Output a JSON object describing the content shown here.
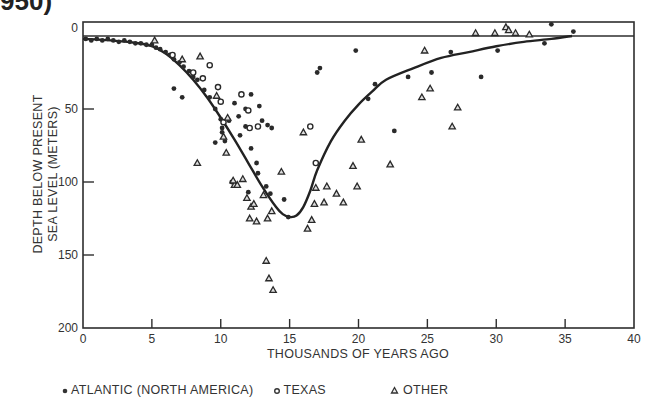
{
  "chart_data": {
    "type": "scatter",
    "title": "",
    "xlabel": "THOUSANDS OF YEARS AGO",
    "ylabel_line1": "DEPTH BELOW PRESENT",
    "ylabel_line2": "SEA LEVEL (METERS)",
    "xlim": [
      0,
      40
    ],
    "ylim": [
      0,
      200
    ],
    "y_inverted": true,
    "x_ticks": [
      0,
      5,
      10,
      15,
      20,
      25,
      30,
      35,
      40
    ],
    "y_ticks": [
      0,
      50,
      100,
      150,
      200
    ],
    "grid": false,
    "legend_position": "bottom",
    "legend": [
      {
        "label": "ATLANTIC (NORTH AMERICA)",
        "marker": "filled-circle"
      },
      {
        "label": "TEXAS",
        "marker": "open-circle"
      },
      {
        "label": "OTHER",
        "marker": "open-triangle"
      }
    ],
    "trend_curve": {
      "name": "fitted sea-level curve",
      "points": [
        [
          0,
          2
        ],
        [
          2,
          3
        ],
        [
          4,
          5
        ],
        [
          5,
          7
        ],
        [
          6,
          12
        ],
        [
          7,
          20
        ],
        [
          8,
          30
        ],
        [
          9,
          42
        ],
        [
          10,
          56
        ],
        [
          11,
          71
        ],
        [
          12,
          87
        ],
        [
          13,
          103
        ],
        [
          14,
          117
        ],
        [
          14.5,
          122
        ],
        [
          15,
          124
        ],
        [
          15.5,
          123
        ],
        [
          16,
          117
        ],
        [
          16.5,
          106
        ],
        [
          17,
          92
        ],
        [
          18,
          72
        ],
        [
          19,
          58
        ],
        [
          20,
          47
        ],
        [
          21,
          38
        ],
        [
          22,
          30
        ],
        [
          24,
          22
        ],
        [
          26,
          15
        ],
        [
          28,
          11
        ],
        [
          30,
          7
        ],
        [
          32,
          4
        ],
        [
          34,
          2
        ],
        [
          35.5,
          0
        ]
      ]
    },
    "series": [
      {
        "name": "ATLANTIC (NORTH AMERICA)",
        "marker": "filled-circle",
        "points": [
          [
            0.2,
            2
          ],
          [
            0.6,
            3
          ],
          [
            1,
            2
          ],
          [
            1.4,
            3
          ],
          [
            1.8,
            2
          ],
          [
            2.2,
            3
          ],
          [
            2.6,
            4
          ],
          [
            3,
            3
          ],
          [
            3.4,
            4
          ],
          [
            3.8,
            5
          ],
          [
            4.2,
            5
          ],
          [
            4.6,
            6
          ],
          [
            5,
            6
          ],
          [
            5.3,
            8
          ],
          [
            5.6,
            9
          ],
          [
            6,
            11
          ],
          [
            6.3,
            13
          ],
          [
            6.6,
            16
          ],
          [
            7,
            18
          ],
          [
            7.3,
            21
          ],
          [
            7.7,
            24
          ],
          [
            8,
            28
          ],
          [
            8.3,
            30
          ],
          [
            6.6,
            36
          ],
          [
            7.2,
            42
          ],
          [
            9.2,
            42
          ],
          [
            9.6,
            50
          ],
          [
            10,
            57
          ],
          [
            10.1,
            63
          ],
          [
            10.1,
            66
          ],
          [
            10.3,
            72
          ],
          [
            10.6,
            58
          ],
          [
            11,
            46
          ],
          [
            11.3,
            55
          ],
          [
            11.8,
            50
          ],
          [
            12.2,
            40
          ],
          [
            12.8,
            48
          ],
          [
            13,
            58
          ],
          [
            13.4,
            61
          ],
          [
            13.7,
            63
          ],
          [
            11.8,
            62
          ],
          [
            11.4,
            68
          ],
          [
            12.2,
            77
          ],
          [
            12.6,
            87
          ],
          [
            12.7,
            94
          ],
          [
            13.3,
            103
          ],
          [
            13.6,
            108
          ],
          [
            14.6,
            112
          ],
          [
            14.9,
            124
          ],
          [
            17,
            25
          ],
          [
            17.2,
            22
          ],
          [
            19.8,
            10
          ],
          [
            20.7,
            43
          ],
          [
            21.2,
            33
          ],
          [
            22.6,
            65
          ],
          [
            23.6,
            28
          ],
          [
            25.3,
            25
          ],
          [
            26.7,
            11
          ],
          [
            28.9,
            28
          ],
          [
            30.1,
            10
          ],
          [
            33.5,
            5
          ],
          [
            34,
            -8
          ],
          [
            35.6,
            -3
          ],
          [
            8.8,
            37
          ],
          [
            9.6,
            73
          ],
          [
            10.8,
            100
          ],
          [
            12,
            107
          ]
        ]
      },
      {
        "name": "TEXAS",
        "marker": "open-circle",
        "points": [
          [
            6.5,
            13
          ],
          [
            8,
            25
          ],
          [
            8.7,
            29
          ],
          [
            9.2,
            20
          ],
          [
            9.8,
            35
          ],
          [
            10,
            45
          ],
          [
            10.2,
            59
          ],
          [
            11.5,
            40
          ],
          [
            12,
            51
          ],
          [
            12.1,
            63
          ],
          [
            12.7,
            62
          ],
          [
            16.5,
            62
          ],
          [
            16.9,
            87
          ]
        ]
      },
      {
        "name": "OTHER",
        "marker": "open-triangle",
        "points": [
          [
            5.2,
            3
          ],
          [
            7.2,
            16
          ],
          [
            8.5,
            14
          ],
          [
            9.7,
            41
          ],
          [
            10.5,
            56
          ],
          [
            10.4,
            80
          ],
          [
            11,
            102
          ],
          [
            11.6,
            98
          ],
          [
            11.9,
            111
          ],
          [
            12.2,
            117
          ],
          [
            12.1,
            125
          ],
          [
            12.6,
            127
          ],
          [
            13.4,
            125
          ],
          [
            13.7,
            120
          ],
          [
            13.1,
            109
          ],
          [
            11.2,
            102
          ],
          [
            12.4,
            115
          ],
          [
            8.3,
            87
          ],
          [
            10.2,
            69
          ],
          [
            10.9,
            99
          ],
          [
            13.3,
            154
          ],
          [
            13.5,
            166
          ],
          [
            13.8,
            174
          ],
          [
            16,
            66
          ],
          [
            16.8,
            115
          ],
          [
            16.3,
            132
          ],
          [
            16.6,
            126
          ],
          [
            16.9,
            104
          ],
          [
            17.7,
            103
          ],
          [
            17.5,
            114
          ],
          [
            18.4,
            108
          ],
          [
            18.9,
            114
          ],
          [
            19.6,
            89
          ],
          [
            19.9,
            103
          ],
          [
            20.2,
            71
          ],
          [
            22.3,
            88
          ],
          [
            24.6,
            42
          ],
          [
            26.8,
            62
          ],
          [
            28.5,
            -2
          ],
          [
            30.7,
            -6
          ],
          [
            30.9,
            -4
          ],
          [
            31.4,
            -2
          ],
          [
            32.4,
            -1
          ],
          [
            29.9,
            -2
          ],
          [
            24.8,
            10
          ],
          [
            25.2,
            36
          ],
          [
            27.2,
            49
          ],
          [
            14.4,
            93
          ]
        ]
      }
    ]
  },
  "header": {
    "fragment": "950)"
  }
}
